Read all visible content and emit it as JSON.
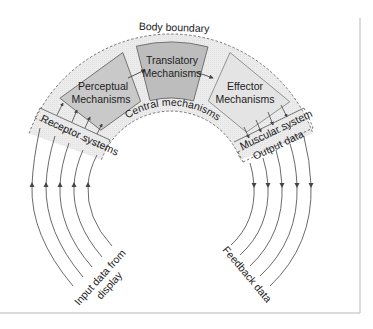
{
  "diagram": {
    "title": "Body boundary",
    "boxes": [
      {
        "id": "perceptual",
        "line1": "Perceptual",
        "line2": "Mechanisms",
        "fill": "#c9c9c9"
      },
      {
        "id": "translatory",
        "line1": "Translatory",
        "line2": "Mechanisms",
        "fill": "#bdbdbd"
      },
      {
        "id": "effector",
        "line1": "Effector",
        "line2": "Mechanisms",
        "fill": "#e4e4e4"
      }
    ],
    "ring_label": "Central mechanisms",
    "ring_fill": "#ececec",
    "bands": {
      "receptor": "Receptor systems",
      "muscular": "Muscular system",
      "output": "Output data"
    },
    "flows": {
      "input": {
        "line1": "Input data from",
        "line2": "display",
        "count": 5,
        "direction": "up"
      },
      "feedback": {
        "label": "Feedback data",
        "count": 5,
        "direction": "down"
      }
    },
    "frame_color": "#cfcfcf",
    "line_color": "#444444"
  }
}
